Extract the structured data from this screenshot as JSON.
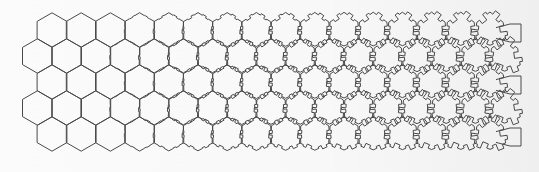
{
  "figure": {
    "kind": "tessellation-metamorphosis",
    "width": 539,
    "height": 172,
    "colors": {
      "background": "#f8f8f8",
      "stroke": "#4a4a4a"
    },
    "grid": {
      "columns": 17,
      "rows": 5,
      "origin_x": 52,
      "origin_y": 30,
      "col_spacing": 29.2,
      "row_spacing": 26,
      "hex_radius": 17.2
    },
    "morph": {
      "plain_hex_columns": 3,
      "notch_start_column": 3,
      "notch_max_depth": 0.55
    },
    "end_caps": {
      "x": 510,
      "y_positions": [
        24,
        76,
        128
      ],
      "width": 11,
      "height": 18
    }
  }
}
